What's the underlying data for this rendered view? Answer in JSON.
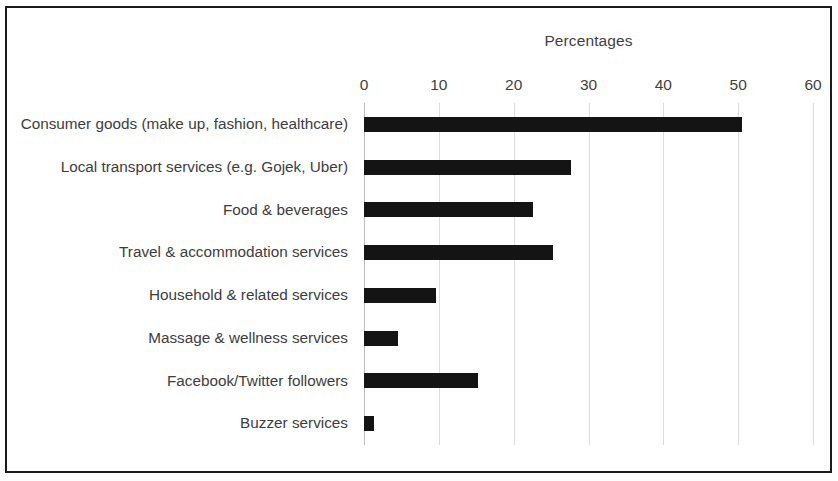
{
  "chart_data": {
    "type": "bar",
    "orientation": "horizontal",
    "title": "Percentages",
    "xlabel": "",
    "ylabel": "",
    "xlim": [
      0,
      60
    ],
    "xticks": [
      0,
      10,
      20,
      30,
      40,
      50,
      60
    ],
    "grid": true,
    "legend": false,
    "bar_color": "#141414",
    "grid_color": "#dcdcdc",
    "text_color": "#3d3d3d",
    "categories": [
      "Consumer goods (make up, fashion, healthcare)",
      "Local transport services (e.g. Gojek, Uber)",
      "Food & beverages",
      "Travel & accommodation services",
      "Household & related services",
      "Massage & wellness services",
      "Facebook/Twitter followers",
      "Buzzer services"
    ],
    "values": [
      50.5,
      27.7,
      22.6,
      25.3,
      9.6,
      4.6,
      15.2,
      1.3
    ]
  }
}
